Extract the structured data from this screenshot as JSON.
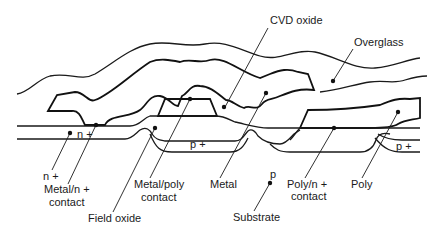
{
  "colors": {
    "line": "#1a1a1a",
    "background": "#ffffff",
    "hatch": "#1a1a1a"
  },
  "labels": {
    "cvd_oxide": "CVD oxide",
    "overglass": "Overglass",
    "n_plus_region_left": "n +",
    "p_plus_center": "p +",
    "n_plus_region_right": "n +",
    "p_plus_right": "p +",
    "n_plus_callout": "n +",
    "metal_n_contact_1": "Metal/n +",
    "metal_n_contact_2": "contact",
    "metal_poly_contact_1": "Metal/poly",
    "metal_poly_contact_2": "contact",
    "field_oxide": "Field oxide",
    "metal": "Metal",
    "substrate_p": "p",
    "substrate": "Substrate",
    "poly_n_contact_1": "Poly/n +",
    "poly_n_contact_2": "contact",
    "poly": "Poly"
  }
}
